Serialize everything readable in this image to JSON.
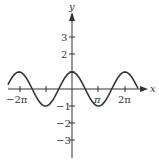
{
  "chart_data": {
    "type": "line",
    "title": "",
    "function": "y = cos(x)",
    "xlabel": "x",
    "ylabel": "y",
    "x_ticks": [
      "-2π",
      "-π",
      "0",
      "π",
      "2π"
    ],
    "x_tick_labels_shown": [
      "−2π",
      "π",
      "2π"
    ],
    "y_ticks": [
      -3,
      -2,
      -1,
      1,
      2,
      3
    ],
    "y_tick_labels": [
      "3",
      "2",
      "−1",
      "−2",
      "−3"
    ],
    "xlim": [
      "-2.5π",
      "2.5π"
    ],
    "ylim": [
      -4,
      4
    ],
    "grid": false,
    "series": [
      {
        "name": "cos(x)",
        "x": [
          "-2.5π",
          "-2π",
          "-1.5π",
          "-π",
          "-0.5π",
          "0",
          "0.5π",
          "π",
          "1.5π",
          "2π",
          "2.5π"
        ],
        "values": [
          0,
          1,
          0,
          -1,
          0,
          1,
          0,
          -1,
          0,
          1,
          0
        ]
      }
    ]
  },
  "labels": {
    "x_axis": "x",
    "y_axis": "y",
    "neg_two_pi": "−2π",
    "pi": "π",
    "two_pi": "2π",
    "y3": "3",
    "y2": "2",
    "yn1": "−1",
    "yn2": "−2",
    "yn3": "−3"
  }
}
